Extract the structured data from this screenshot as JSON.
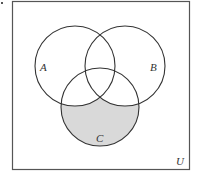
{
  "diagram": {
    "type": "venn",
    "universe_label": "U",
    "sets": [
      {
        "label": "A",
        "cx": 75,
        "cy": 66,
        "r": 40,
        "label_x": 43,
        "label_y": 71
      },
      {
        "label": "B",
        "cx": 125,
        "cy": 66,
        "r": 40,
        "label_x": 153,
        "label_y": 71
      },
      {
        "label": "C",
        "cx": 100,
        "cy": 107,
        "r": 39,
        "label_x": 99,
        "label_y": 142
      }
    ],
    "shaded_region": "C \\ (A ∪ B)",
    "colors": {
      "shade": "#d9d9d9",
      "stroke": "#333333",
      "frame": "#555555",
      "background": "#ffffff"
    },
    "frame": {
      "x": 12,
      "y": 1,
      "width": 178,
      "height": 169
    }
  }
}
